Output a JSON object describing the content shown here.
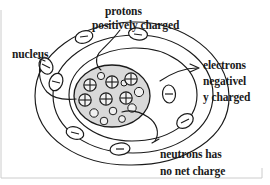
{
  "figure": {
    "background_color": "#ffffff",
    "stroke_color": "#1a1a1a",
    "nucleus_fill_color": "#d9d9d9",
    "text_color": "#1a1a1a"
  },
  "labels": {
    "protons": "protons",
    "protons_sub": "positively charged",
    "nucleus": "nucleus",
    "electrons": "electrons",
    "electrons_line2": "negativel",
    "electrons_line3": "y charged",
    "neutrons": "neutrons has",
    "neutrons_line2": "no net charge"
  },
  "diagram_data": {
    "type": "diagram",
    "subject": "Atom (Bohr model)",
    "shells": [
      {
        "name": "inner-shell",
        "rx": 62,
        "ry": 50,
        "electron_count": 2
      },
      {
        "name": "middle-shell",
        "rx": 78,
        "ry": 62,
        "electron_count": 3
      },
      {
        "name": "outer-shell",
        "rx": 95,
        "ry": 74,
        "electron_count": 3
      }
    ],
    "nucleus": {
      "proton_count": 6,
      "proton_symbol": "+",
      "neutron_count": 9,
      "neutron_symbol": ""
    },
    "electron_symbol": "-",
    "leader_lines": [
      {
        "from": "protons",
        "to": "nucleus-protons"
      },
      {
        "from": "nucleus",
        "to": "nucleus-boundary"
      },
      {
        "from": "electrons",
        "to": "outer-shell-electron"
      },
      {
        "from": "neutrons",
        "to": "nucleus-neutrons"
      }
    ]
  }
}
